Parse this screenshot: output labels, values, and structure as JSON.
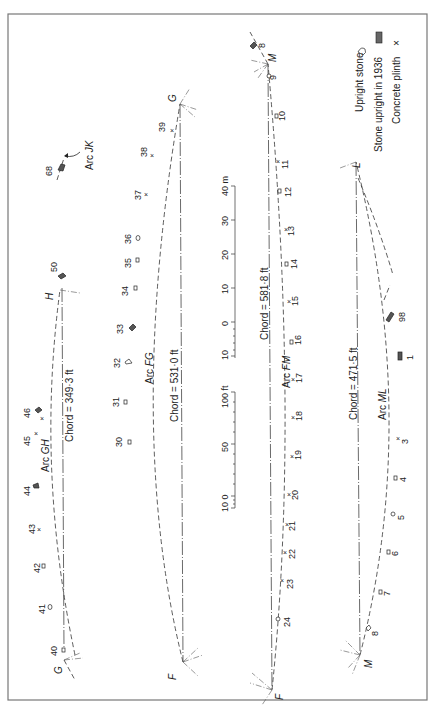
{
  "figure": {
    "orientation": "rotated -90deg (landscape plan printed sideways)",
    "legend": {
      "items": [
        {
          "label": "Upright stone",
          "symbol": "open-stone-outline"
        },
        {
          "label": "Stone upright in 1936",
          "symbol": "hatched-stone"
        },
        {
          "label": "Concrete plinth",
          "symbol": "x"
        }
      ]
    },
    "arcs": [
      {
        "name": "Arc GH",
        "label_prefix": "Arc ",
        "label_letters": "GH",
        "endpoints": [
          "G",
          "H"
        ],
        "chord": "Chord = 349·3 ft",
        "stones": [
          "40",
          "41",
          "42",
          "43",
          "44",
          "45",
          "46",
          "50"
        ]
      },
      {
        "name": "Arc FG",
        "label_prefix": "Arc ",
        "label_letters": "FG",
        "endpoints": [
          "F",
          "G"
        ],
        "chord": "Chord = 531·0 ft",
        "stones": [
          "30",
          "31",
          "32",
          "33",
          "34",
          "35",
          "36",
          "37",
          "38",
          "39"
        ]
      },
      {
        "name": "Arc FM",
        "label_prefix": "Arc ",
        "label_letters": "FM",
        "endpoints": [
          "F",
          "M"
        ],
        "chord": "Chord = 581·8 ft",
        "stones": [
          "8",
          "9",
          "10",
          "11",
          "12",
          "13",
          "14",
          "15",
          "16",
          "17",
          "18",
          "19",
          "20",
          "21",
          "22",
          "23",
          "24"
        ]
      },
      {
        "name": "Arc ML",
        "label_prefix": "Arc ",
        "label_letters": "ML",
        "endpoints": [
          "M",
          "L"
        ],
        "chord": "Chord = 471·5 ft",
        "stones": [
          "98",
          "1",
          "3",
          "4",
          "5",
          "6",
          "7",
          "8"
        ]
      },
      {
        "name": "Arc JK",
        "label_prefix": "Arc ",
        "label_letters": "JK",
        "endpoints": [],
        "chord": "",
        "stones": [
          "68"
        ]
      }
    ],
    "point_labels": {
      "G1": "G",
      "H": "H",
      "G2": "G",
      "F1": "F",
      "M1": "M",
      "F2": "F",
      "L": "L",
      "M2": "M"
    },
    "stone_labels": {
      "s68": "68",
      "s50": "50",
      "s40": "40",
      "s41": "41",
      "s42": "42",
      "s43": "43",
      "s44": "44",
      "s45": "45",
      "s46": "46",
      "s30": "30",
      "s31": "31",
      "s32": "32",
      "s33": "33",
      "s34": "34",
      "s35": "35",
      "s36": "36",
      "s37": "37",
      "s38": "38",
      "s39": "39",
      "s8a": "8",
      "s9": "9",
      "s10": "10",
      "s11": "11",
      "s12": "12",
      "s13": "13",
      "s14": "14",
      "s15": "15",
      "s16": "16",
      "s17": "17",
      "s18": "18",
      "s19": "19",
      "s20": "20",
      "s21": "21",
      "s22": "22",
      "s23": "23",
      "s24": "24",
      "s98": "98",
      "s1": "1",
      "s3": "3",
      "s4": "4",
      "s5": "5",
      "s6": "6",
      "s7": "7",
      "s8b": "8"
    },
    "scale_metres": {
      "unit_label": "40 m",
      "ticks": [
        "10",
        "0",
        "10",
        "20",
        "30",
        "40 m"
      ]
    },
    "scale_feet": {
      "unit_label": "100 ft",
      "ticks": [
        "10 0",
        "50",
        "100 ft"
      ]
    },
    "plinth_mark": "×"
  }
}
